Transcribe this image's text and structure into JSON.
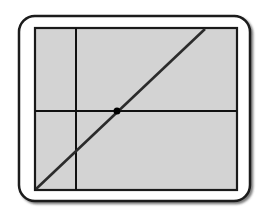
{
  "diagram": {
    "frame": {
      "fill": "#ffffff",
      "stroke": "#1a1a1a",
      "shadow": "#555555"
    },
    "plot_area": {
      "fill": "#d3d3d3",
      "stroke": "#1a1a1a"
    },
    "axes": {
      "vertical_axis_x": 76,
      "horizontal_axis_y": 111,
      "color": "#111111"
    },
    "line": {
      "start": [
        35,
        190
      ],
      "end": [
        205,
        28
      ],
      "color": "#2b2b2b"
    },
    "point": {
      "cx": 117,
      "cy": 111,
      "r": 3.5,
      "color": "#000000"
    }
  }
}
